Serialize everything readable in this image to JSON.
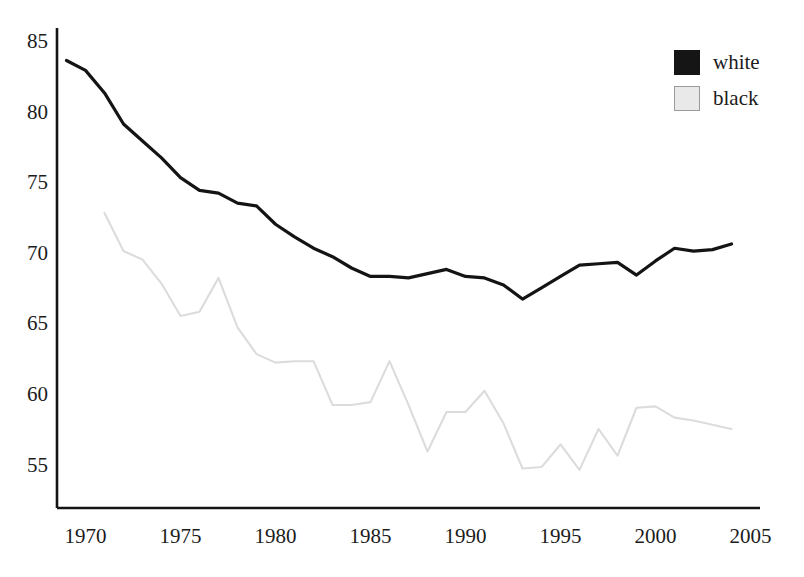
{
  "chart_data": {
    "type": "line",
    "title": "",
    "xlabel": "",
    "ylabel": "",
    "xlim": [
      1968.5,
      2005.5
    ],
    "ylim": [
      52.0,
      86.0
    ],
    "grid": false,
    "legend_position": "top-right",
    "x_ticks": [
      1970,
      1975,
      1980,
      1985,
      1990,
      1995,
      2000,
      2005
    ],
    "y_ticks": [
      55,
      60,
      65,
      70,
      75,
      80,
      85
    ],
    "series": [
      {
        "name": "white",
        "color": "#141414",
        "swatch": "filled",
        "x": [
          1969,
          1970,
          1971,
          1972,
          1973,
          1974,
          1975,
          1976,
          1977,
          1978,
          1979,
          1980,
          1981,
          1982,
          1983,
          1984,
          1985,
          1986,
          1987,
          1988,
          1989,
          1990,
          1991,
          1992,
          1993,
          1994,
          1995,
          1996,
          1997,
          1998,
          1999,
          2000,
          2001,
          2002,
          2003,
          2004
        ],
        "values": [
          83.7,
          83.0,
          81.4,
          79.2,
          78.0,
          76.8,
          75.4,
          74.5,
          74.3,
          73.6,
          73.4,
          72.1,
          71.2,
          70.4,
          69.8,
          69.0,
          68.4,
          68.4,
          68.3,
          68.6,
          68.9,
          68.4,
          68.3,
          67.8,
          66.8,
          67.6,
          68.4,
          69.2,
          69.3,
          69.4,
          68.5,
          69.5,
          70.4,
          70.2,
          70.3,
          70.7
        ]
      },
      {
        "name": "black",
        "color": "#dcdcdc",
        "swatch": "hollow",
        "x": [
          1971,
          1972,
          1973,
          1974,
          1975,
          1976,
          1977,
          1978,
          1979,
          1980,
          1981,
          1982,
          1983,
          1984,
          1985,
          1986,
          1987,
          1988,
          1989,
          1990,
          1991,
          1992,
          1993,
          1994,
          1995,
          1996,
          1997,
          1998,
          1999,
          2000,
          2001,
          2002,
          2003,
          2004
        ],
        "values": [
          72.9,
          70.2,
          69.6,
          67.9,
          65.6,
          65.9,
          68.3,
          64.8,
          62.9,
          62.3,
          62.4,
          62.4,
          59.3,
          59.3,
          59.5,
          62.4,
          59.3,
          56.0,
          58.8,
          58.8,
          60.3,
          58.0,
          54.8,
          54.9,
          56.5,
          54.7,
          57.6,
          55.7,
          59.1,
          59.2,
          58.4,
          58.2,
          57.9,
          57.6
        ]
      }
    ]
  },
  "axes": {
    "y_tick_labels": [
      "85",
      "80",
      "75",
      "70",
      "65",
      "60",
      "55"
    ],
    "x_tick_labels": [
      "1970",
      "1975",
      "1980",
      "1985",
      "1990",
      "1995",
      "2000",
      "2005"
    ],
    "axis_color": "#141414"
  },
  "legend": {
    "items": [
      {
        "label": "white",
        "swatch": "filled"
      },
      {
        "label": "black",
        "swatch": "hollow"
      }
    ]
  }
}
